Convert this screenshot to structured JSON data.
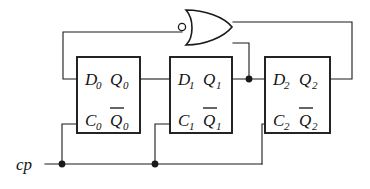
{
  "diagram": {
    "background_color": "#ffffff",
    "line_color": "#1a1a1a",
    "text_color": "#141414"
  },
  "clock": {
    "label": "cp"
  },
  "gate": {
    "type": "NOR",
    "bubble": "inversion-bubble"
  },
  "flipflops": [
    {
      "name": "flip-flop-0",
      "d_label": "D",
      "d_sub": "0",
      "q_label": "Q",
      "q_sub": "0",
      "c_label": "C",
      "c_sub": "0",
      "qbar_label": "Q",
      "qbar_sub": "0"
    },
    {
      "name": "flip-flop-1",
      "d_label": "D",
      "d_sub": "1",
      "q_label": "Q",
      "q_sub": "1",
      "c_label": "C",
      "c_sub": "1",
      "qbar_label": "Q",
      "qbar_sub": "1"
    },
    {
      "name": "flip-flop-2",
      "d_label": "D",
      "d_sub": "2",
      "q_label": "Q",
      "q_sub": "2",
      "c_label": "C",
      "c_sub": "2",
      "qbar_label": "Q",
      "qbar_sub": "2"
    }
  ]
}
